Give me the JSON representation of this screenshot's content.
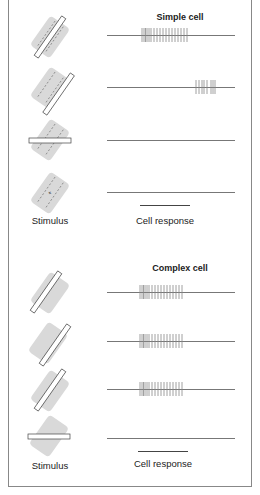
{
  "simple_panel": {
    "title": "Simple cell",
    "stimulus_label": "Stimulus",
    "response_label": "Cell response",
    "rows": [
      {
        "stimulus": "bar-aligned-on-center",
        "response": "strong-burst"
      },
      {
        "stimulus": "bar-offset-on-flank",
        "response": "late-burst"
      },
      {
        "stimulus": "bar-horizontal",
        "response": "none"
      },
      {
        "stimulus": "no-bar",
        "response": "none"
      }
    ]
  },
  "complex_panel": {
    "title": "Complex cell",
    "stimulus_label": "Stimulus",
    "response_label": "Cell response",
    "rows": [
      {
        "stimulus": "bar-left-of-field",
        "response": "strong-burst"
      },
      {
        "stimulus": "bar-right-of-field",
        "response": "strong-burst"
      },
      {
        "stimulus": "bar-center-of-field",
        "response": "strong-burst"
      },
      {
        "stimulus": "bar-horizontal",
        "response": "none"
      }
    ]
  },
  "colors": {
    "field": "#d9d9d9",
    "line": "#777777",
    "spike": "#888888",
    "border": "#888888"
  }
}
